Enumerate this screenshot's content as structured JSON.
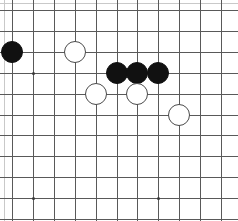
{
  "board": {
    "type": "go-board-diagram",
    "grid": {
      "origin_x": 12,
      "origin_y": 10,
      "spacing": 20.9,
      "cols": 11,
      "rows": 11,
      "line_color": "#595959",
      "edge_faint_color": "#c9c9c9",
      "background": "#ffffff"
    },
    "stone_radius": 11,
    "star_points": [
      {
        "col": 1,
        "row": 3
      },
      {
        "col": 1,
        "row": 9
      },
      {
        "col": 7,
        "row": 9
      }
    ],
    "stones": [
      {
        "color": "black",
        "col": 0,
        "row": 2,
        "label": "black-stone-a"
      },
      {
        "color": "white",
        "col": 3,
        "row": 2,
        "label": "white-stone-a"
      },
      {
        "color": "black",
        "col": 5,
        "row": 3,
        "label": "black-stone-b"
      },
      {
        "color": "black",
        "col": 6,
        "row": 3,
        "label": "black-stone-c"
      },
      {
        "color": "black",
        "col": 7,
        "row": 3,
        "label": "black-stone-d"
      },
      {
        "color": "white",
        "col": 4,
        "row": 4,
        "label": "white-stone-b"
      },
      {
        "color": "white",
        "col": 6,
        "row": 4,
        "label": "white-stone-c"
      },
      {
        "color": "white",
        "col": 8,
        "row": 5,
        "label": "white-stone-d"
      }
    ]
  }
}
